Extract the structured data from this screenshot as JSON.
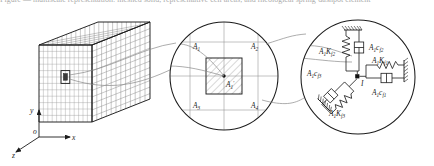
{
  "figure": {
    "header_text": "Figure — multiscale representation: meshed solid, representative cell areas, and rheological spring-dashpot element",
    "axes": {
      "x": "x",
      "y": "y",
      "z": "z",
      "origin": "o"
    },
    "cell_circle": {
      "areas": [
        "A",
        "A",
        "A",
        "A"
      ],
      "area_subs": [
        "1",
        "2",
        "3",
        "4"
      ],
      "center_label": "A",
      "center_sub": "1",
      "center_prime": "'"
    },
    "element_circle": {
      "top_spring": {
        "coef": "A",
        "coef_sub": "1",
        "sym": "K",
        "sym_sub": "f2"
      },
      "top_damper": {
        "coef": "A",
        "coef_sub": "1",
        "sym": "c",
        "sym_sub": "f2"
      },
      "right_spring": {
        "coef": "A",
        "coef_sub": "1",
        "sym": "K",
        "sym_sub": "f1"
      },
      "right_damper": {
        "coef": "A",
        "coef_sub": "1",
        "sym": "c",
        "sym_sub": "f1"
      },
      "diag_spring": {
        "coef": "A",
        "coef_sub": "1",
        "sym": "K",
        "sym_sub": "f3"
      },
      "diag_damper": {
        "coef": "A",
        "coef_sub": "1",
        "sym": "c",
        "sym_sub": "f3"
      },
      "node_label": "I"
    },
    "colors": {
      "line": "#1c1c1c",
      "mesh": "#6f6f6f",
      "mesh_light": "#9a9a9a",
      "hatch": "#8c8c8c",
      "guide": "#8a8a8a",
      "background": "#ffffff"
    }
  }
}
